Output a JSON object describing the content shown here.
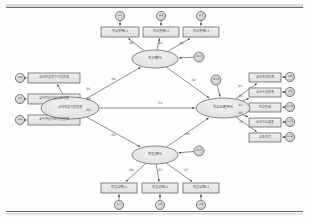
{
  "figure": {
    "type": "sem-path-diagram",
    "style": "amos-output",
    "latent_variables": [
      {
        "id": "L1",
        "label": "교사학습지원환경",
        "cx": 70,
        "cy": 108,
        "rx": 29,
        "ry": 11
      },
      {
        "id": "L2",
        "label": "학교행복도",
        "cx": 155,
        "cy": 59,
        "rx": 23,
        "ry": 9
      },
      {
        "id": "L3",
        "label": "학업성취도",
        "cx": 155,
        "cy": 155,
        "rx": 23,
        "ry": 9
      },
      {
        "id": "L4",
        "label": "학교교육만족도",
        "cx": 223,
        "cy": 108,
        "rx": 27,
        "ry": 10
      }
    ],
    "observed_variables": [
      {
        "id": "O1",
        "label": "학교행복도1",
        "x": 101,
        "y": 27,
        "w": 38,
        "h": 10
      },
      {
        "id": "O2",
        "label": "학교행복도2",
        "x": 143,
        "y": 27,
        "w": 36,
        "h": 10
      },
      {
        "id": "O3",
        "label": "학교행복도3",
        "x": 183,
        "y": 27,
        "w": 36,
        "h": 10
      },
      {
        "id": "O4",
        "label": "교사학습연구지원환경",
        "x": 28,
        "y": 73,
        "w": 52,
        "h": 10
      },
      {
        "id": "O5",
        "label": "교사학습지원상호작용",
        "x": 28,
        "y": 94,
        "w": 52,
        "h": 10
      },
      {
        "id": "O6",
        "label": "교수학습자료지원환경",
        "x": 28,
        "y": 115,
        "w": 52,
        "h": 10
      },
      {
        "id": "O7",
        "label": "학업성취도1",
        "x": 101,
        "y": 183,
        "w": 36,
        "h": 10
      },
      {
        "id": "O8",
        "label": "학업성취도2",
        "x": 142,
        "y": 183,
        "w": 36,
        "h": 10
      },
      {
        "id": "O9",
        "label": "학업성취도3",
        "x": 183,
        "y": 183,
        "w": 36,
        "h": 10
      },
      {
        "id": "O10",
        "label": "교사학생관계",
        "x": 249,
        "y": 73,
        "w": 32,
        "h": 9
      },
      {
        "id": "O11",
        "label": "교사수업만족",
        "x": 249,
        "y": 88,
        "w": 32,
        "h": 9
      },
      {
        "id": "O12",
        "label": "학교환경",
        "x": 249,
        "y": 103,
        "w": 32,
        "h": 9
      },
      {
        "id": "O13",
        "label": "교사지도활동",
        "x": 249,
        "y": 118,
        "w": 32,
        "h": 9
      },
      {
        "id": "O14",
        "label": "교육여건",
        "x": 249,
        "y": 133,
        "w": 32,
        "h": 9
      }
    ],
    "error_terms": [
      {
        "id": "e1",
        "label": "e1",
        "cx": 120,
        "cy": 16,
        "r": 4.6
      },
      {
        "id": "e2",
        "label": "e2",
        "cx": 161,
        "cy": 16,
        "r": 4.6
      },
      {
        "id": "e3",
        "label": "e3",
        "cx": 201,
        "cy": 16,
        "r": 4.6
      },
      {
        "id": "e4",
        "label": "e4",
        "cx": 20,
        "cy": 78,
        "r": 4.6
      },
      {
        "id": "e5",
        "label": "e5",
        "cx": 20,
        "cy": 99,
        "r": 4.6
      },
      {
        "id": "e6",
        "label": "e6",
        "cx": 20,
        "cy": 120,
        "r": 4.6
      },
      {
        "id": "e7",
        "label": "e7",
        "cx": 119,
        "cy": 205,
        "r": 4.6
      },
      {
        "id": "e8",
        "label": "e8",
        "cx": 160,
        "cy": 205,
        "r": 4.6
      },
      {
        "id": "e9",
        "label": "e9",
        "cx": 201,
        "cy": 205,
        "r": 4.6
      },
      {
        "id": "e10",
        "label": "e8",
        "cx": 290,
        "cy": 77,
        "r": 4.6
      },
      {
        "id": "e11",
        "label": "e9",
        "cx": 290,
        "cy": 92,
        "r": 4.6
      },
      {
        "id": "e12",
        "label": "e10",
        "cx": 290,
        "cy": 107,
        "r": 4.6
      },
      {
        "id": "e13",
        "label": "e11",
        "cx": 290,
        "cy": 122,
        "r": 4.6
      },
      {
        "id": "e14",
        "label": "e12",
        "cx": 290,
        "cy": 137,
        "r": 4.6
      },
      {
        "id": "d13",
        "label": "d13",
        "cx": 199,
        "cy": 57,
        "r": 5.0
      },
      {
        "id": "d14",
        "label": "d14",
        "cx": 216,
        "cy": 80,
        "r": 5.0
      },
      {
        "id": "d15",
        "label": "d15",
        "cx": 199,
        "cy": 151,
        "r": 5.0
      }
    ],
    "paths": [
      {
        "from": "L2",
        "to": "O1",
        "coef": ".95",
        "lx": 131,
        "ly": 43
      },
      {
        "from": "L2",
        "to": "O2",
        "coef": ".96",
        "lx": 160,
        "ly": 43
      },
      {
        "from": "L2",
        "to": "O3",
        "coef": ".85",
        "lx": 181,
        "ly": 43
      },
      {
        "from": "L1",
        "to": "O4",
        "coef": ".91",
        "lx": 88,
        "ly": 89
      },
      {
        "from": "L1",
        "to": "O5",
        "coef": ".88",
        "lx": 88,
        "ly": 99
      },
      {
        "from": "L1",
        "to": "O6",
        "coef": ".80",
        "lx": 88,
        "ly": 110
      },
      {
        "from": "L3",
        "to": "O7",
        "coef": ".84",
        "lx": 131,
        "ly": 170
      },
      {
        "from": "L3",
        "to": "O8",
        "coef": ".87",
        "lx": 160,
        "ly": 170
      },
      {
        "from": "L3",
        "to": "O9",
        "coef": ".87",
        "lx": 186,
        "ly": 170
      },
      {
        "from": "L4",
        "to": "O10",
        "coef": ".91",
        "lx": 240,
        "ly": 86
      },
      {
        "from": "L4",
        "to": "O11",
        "coef": ".84",
        "lx": 240,
        "ly": 96
      },
      {
        "from": "L4",
        "to": "O12",
        "coef": ".91",
        "lx": 240,
        "ly": 105
      },
      {
        "from": "L4",
        "to": "O13",
        "coef": ".80",
        "lx": 240,
        "ly": 113
      },
      {
        "from": "L4",
        "to": "O14",
        "coef": ".79",
        "lx": 240,
        "ly": 122
      },
      {
        "from": "L1",
        "to": "L2",
        "coef": ".40",
        "lx": 113,
        "ly": 79
      },
      {
        "from": "L1",
        "to": "L3",
        "coef": ".60",
        "lx": 113,
        "ly": 135
      },
      {
        "from": "L1",
        "to": "L4",
        "coef": ".51",
        "lx": 160,
        "ly": 103
      },
      {
        "from": "L2",
        "to": "L4",
        "coef": ".40",
        "lx": 193,
        "ly": 80
      },
      {
        "from": "L3",
        "to": "L4",
        "coef": ".06",
        "lx": 187,
        "ly": 134
      }
    ]
  }
}
